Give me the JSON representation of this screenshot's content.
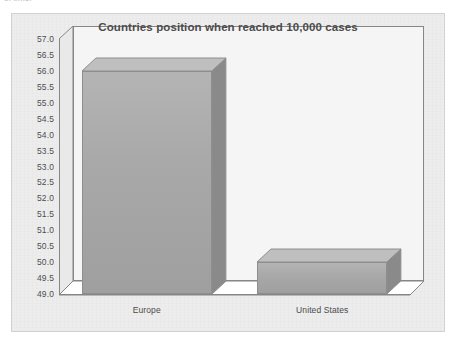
{
  "page": {
    "cut_off_text_fragment": "of time."
  },
  "chart": {
    "title": "Countries position when reached 10,000 cases"
  },
  "chart_data": {
    "type": "bar",
    "title": "Countries position when reached 10,000 cases",
    "xlabel": "",
    "ylabel": "",
    "categories": [
      "Europe",
      "United States"
    ],
    "values": [
      56.0,
      50.0
    ],
    "ylim": [
      49.0,
      57.0
    ],
    "ytick_step": 0.5,
    "yticks": [
      "49.0",
      "49.5",
      "50.0",
      "50.5",
      "51.0",
      "51.5",
      "52.0",
      "52.5",
      "53.0",
      "53.5",
      "54.0",
      "54.5",
      "55.0",
      "55.5",
      "56.0",
      "56.5",
      "57.0"
    ],
    "ytick_values": [
      49.0,
      49.5,
      50.0,
      50.5,
      51.0,
      51.5,
      52.0,
      52.5,
      53.0,
      53.5,
      54.0,
      54.5,
      55.0,
      55.5,
      56.0,
      56.5,
      57.0
    ],
    "grid": false,
    "legend": false,
    "style": "3d-column",
    "colors": {
      "bar_fill": "#a9a9a9",
      "bar_top": "#bfbfbf",
      "bar_side": "#8a8a8a",
      "bar_border": "#8e8e8e",
      "plot_background": "#f5f5f5",
      "chart_background": "#ededed",
      "axis_line": "#868686",
      "text": "#4c4c4c"
    }
  }
}
